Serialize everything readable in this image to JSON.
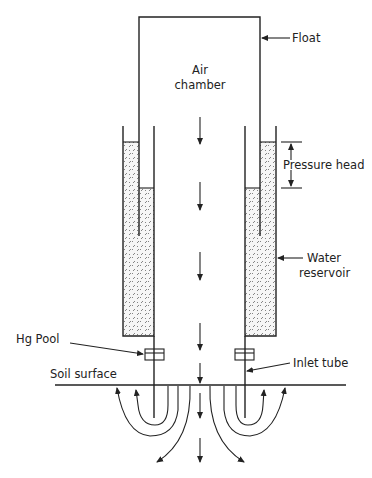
{
  "diagram": {
    "title": "",
    "labels": {
      "float": "Float",
      "air_chamber_line1": "Air",
      "air_chamber_line2": "chamber",
      "pressure_head": "Pressure head",
      "water_reservoir_line1": "Water",
      "water_reservoir_line2": "reservoir",
      "hg_pool": "Hg Pool",
      "inlet_tube": "Inlet tube",
      "soil_surface": "Soil surface"
    },
    "colors": {
      "ink": "#222222",
      "water_fill": "#f4f4f4",
      "background": "#ffffff"
    }
  }
}
